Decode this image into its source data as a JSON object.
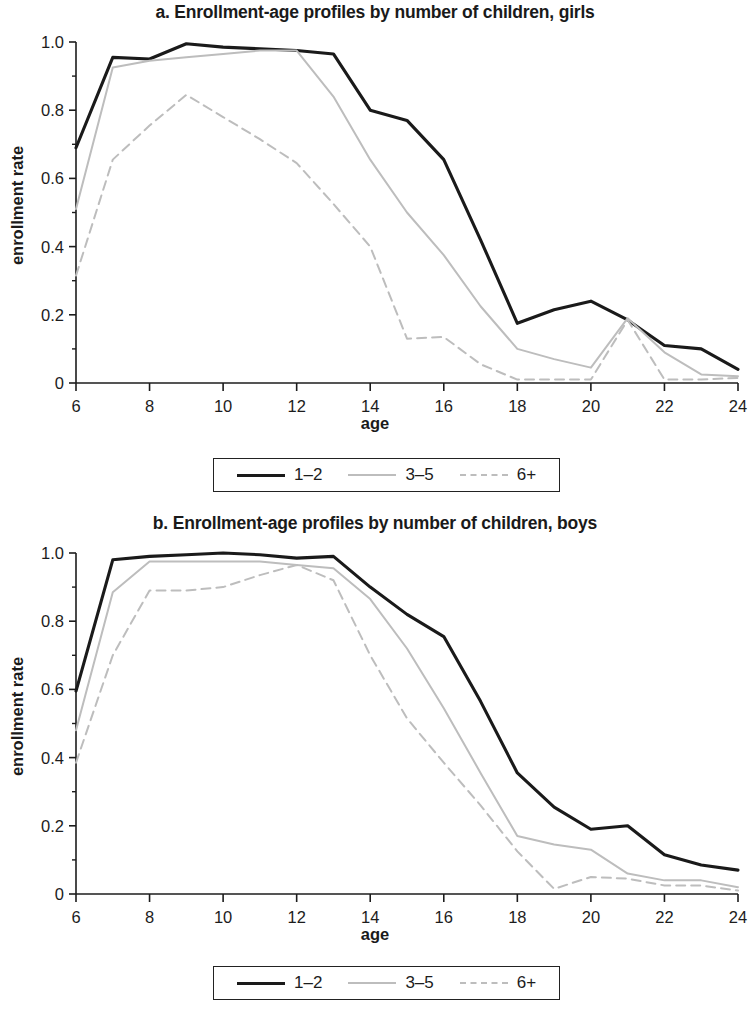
{
  "chart_data": [
    {
      "type": "line",
      "panel": "a",
      "title": "a. Enrollment-age profiles by number of children, girls",
      "xlabel": "age",
      "ylabel": "enrollment rate",
      "xlim": [
        6,
        24
      ],
      "ylim": [
        0,
        1.0
      ],
      "xticks": [
        6,
        8,
        10,
        12,
        14,
        16,
        18,
        20,
        22,
        24
      ],
      "xticklabels": [
        "6",
        "8",
        "10",
        "12",
        "14",
        "16",
        "18",
        "20",
        "22",
        "24"
      ],
      "yticks": [
        0,
        0.2,
        0.4,
        0.6,
        0.8,
        1.0
      ],
      "yticklabels": [
        "0",
        "0.2",
        "0.4",
        "0.6",
        "0.8",
        "1.0"
      ],
      "grid": false,
      "legend_position": "below-center",
      "x": [
        6,
        7,
        8,
        9,
        10,
        11,
        12,
        13,
        14,
        15,
        16,
        17,
        18,
        19,
        20,
        21,
        22,
        23,
        24
      ],
      "series": [
        {
          "name": "1-2",
          "style": "solid",
          "color": "#1a1a1a",
          "values": [
            0.69,
            0.955,
            0.95,
            0.995,
            0.985,
            0.98,
            0.975,
            0.965,
            0.8,
            0.77,
            0.655,
            0.42,
            0.175,
            0.215,
            0.24,
            0.185,
            0.11,
            0.1,
            0.04
          ]
        },
        {
          "name": "3-5",
          "style": "solid",
          "color": "#bdbdbd",
          "values": [
            0.51,
            0.925,
            0.945,
            0.955,
            0.965,
            0.975,
            0.975,
            0.84,
            0.655,
            0.5,
            0.375,
            0.225,
            0.1,
            0.07,
            0.045,
            0.19,
            0.09,
            0.025,
            0.02
          ]
        },
        {
          "name": "6+",
          "style": "dashed",
          "color": "#bdbdbd",
          "values": [
            0.315,
            0.655,
            0.755,
            0.845,
            0.78,
            0.715,
            0.645,
            0.525,
            0.4,
            0.13,
            0.135,
            0.055,
            0.01,
            0.01,
            0.01,
            0.185,
            0.01,
            0.01,
            0.015
          ]
        }
      ],
      "legend": [
        {
          "label": "1-2",
          "style": "solid",
          "color": "#1a1a1a"
        },
        {
          "label": "3-5",
          "style": "solid",
          "color": "#bdbdbd"
        },
        {
          "label": "6+",
          "style": "dashed",
          "color": "#bdbdbd"
        }
      ]
    },
    {
      "type": "line",
      "panel": "b",
      "title": "b. Enrollment-age profiles by number of children, boys",
      "xlabel": "age",
      "ylabel": "enrollment rate",
      "xlim": [
        6,
        24
      ],
      "ylim": [
        0,
        1.0
      ],
      "xticks": [
        6,
        8,
        10,
        12,
        14,
        16,
        18,
        20,
        22,
        24
      ],
      "xticklabels": [
        "6",
        "8",
        "10",
        "12",
        "14",
        "16",
        "18",
        "20",
        "22",
        "24"
      ],
      "yticks": [
        0,
        0.2,
        0.4,
        0.6,
        0.8,
        1.0
      ],
      "yticklabels": [
        "0",
        "0.2",
        "0.4",
        "0.6",
        "0.8",
        "1.0"
      ],
      "grid": false,
      "legend_position": "below-center",
      "x": [
        6,
        7,
        8,
        9,
        10,
        11,
        12,
        13,
        14,
        15,
        16,
        17,
        18,
        19,
        20,
        21,
        22,
        23,
        24
      ],
      "series": [
        {
          "name": "1-2",
          "style": "solid",
          "color": "#1a1a1a",
          "values": [
            0.595,
            0.98,
            0.99,
            0.995,
            1.0,
            0.995,
            0.985,
            0.99,
            0.9,
            0.82,
            0.755,
            0.565,
            0.355,
            0.255,
            0.19,
            0.2,
            0.115,
            0.085,
            0.07
          ]
        },
        {
          "name": "3-5",
          "style": "solid",
          "color": "#bdbdbd",
          "values": [
            0.48,
            0.885,
            0.975,
            0.975,
            0.975,
            0.975,
            0.965,
            0.955,
            0.865,
            0.72,
            0.545,
            0.355,
            0.17,
            0.145,
            0.13,
            0.06,
            0.04,
            0.04,
            0.02
          ]
        },
        {
          "name": "6+",
          "style": "dashed",
          "color": "#bdbdbd",
          "values": [
            0.385,
            0.7,
            0.89,
            0.89,
            0.9,
            0.935,
            0.965,
            0.92,
            0.7,
            0.515,
            0.385,
            0.26,
            0.125,
            0.015,
            0.05,
            0.045,
            0.025,
            0.025,
            0.01
          ]
        }
      ],
      "legend": [
        {
          "label": "1-2",
          "style": "solid",
          "color": "#1a1a1a"
        },
        {
          "label": "3-5",
          "style": "solid",
          "color": "#bdbdbd"
        },
        {
          "label": "6+",
          "style": "dashed",
          "color": "#bdbdbd"
        }
      ]
    }
  ]
}
